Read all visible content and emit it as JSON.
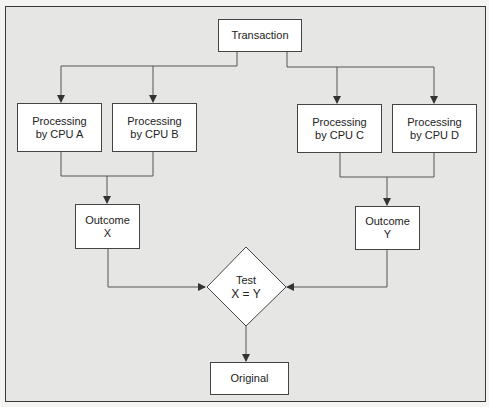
{
  "diagram": {
    "type": "flowchart",
    "nodes": {
      "transaction": {
        "label": "Transaction"
      },
      "cpu_a": {
        "line1": "Processing",
        "line2": "by CPU A"
      },
      "cpu_b": {
        "line1": "Processing",
        "line2": "by CPU B"
      },
      "cpu_c": {
        "line1": "Processing",
        "line2": "by CPU C"
      },
      "cpu_d": {
        "line1": "Processing",
        "line2": "by CPU D"
      },
      "outcome_x": {
        "line1": "Outcome",
        "line2": "X"
      },
      "outcome_y": {
        "line1": "Outcome",
        "line2": "Y"
      },
      "test": {
        "line1": "Test",
        "line2": "X = Y",
        "shape": "diamond"
      },
      "original": {
        "label": "Original"
      }
    },
    "edges": [
      {
        "from": "transaction",
        "to": "cpu_a"
      },
      {
        "from": "transaction",
        "to": "cpu_b"
      },
      {
        "from": "transaction",
        "to": "cpu_c"
      },
      {
        "from": "transaction",
        "to": "cpu_d"
      },
      {
        "from": "cpu_a",
        "to": "outcome_x"
      },
      {
        "from": "cpu_b",
        "to": "outcome_x"
      },
      {
        "from": "cpu_c",
        "to": "outcome_y"
      },
      {
        "from": "cpu_d",
        "to": "outcome_y"
      },
      {
        "from": "outcome_x",
        "to": "test"
      },
      {
        "from": "outcome_y",
        "to": "test"
      },
      {
        "from": "test",
        "to": "original"
      }
    ],
    "colors": {
      "background": "#e6e6e4",
      "box_fill": "#ffffff",
      "line": "#444444"
    }
  }
}
